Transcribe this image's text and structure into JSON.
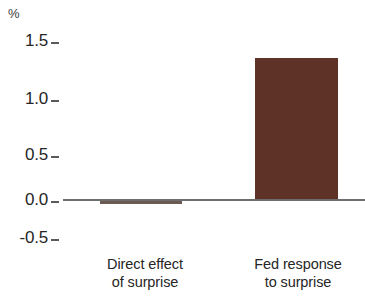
{
  "chart_data": {
    "type": "bar",
    "title": "",
    "subtitle": "",
    "xlabel": "",
    "ylabel": "%",
    "unit_label": "%",
    "categories": [
      "Direct effect of surprise",
      "Fed response to surprise"
    ],
    "category_lines": [
      [
        "Direct effect",
        "of surprise"
      ],
      [
        "Fed response",
        "to surprise"
      ]
    ],
    "values": [
      -0.03,
      1.33
    ],
    "ylim": [
      -0.5,
      1.5
    ],
    "yticks": [
      1.5,
      1.0,
      0.5,
      0.0,
      -0.5
    ],
    "ytick_labels": [
      "1.5",
      "1.0",
      "0.5",
      "0.0",
      "-0.5"
    ],
    "grid": false,
    "legend": null,
    "legend_position": "none",
    "bar_colors": [
      "#6a5a52",
      "#5e3226"
    ],
    "zero_line_color": "#6e6e6e",
    "annotations": []
  },
  "axis": {
    "unit": "%",
    "ticks": [
      {
        "label": "1.5",
        "value": 1.5
      },
      {
        "label": "1.0",
        "value": 1.0
      },
      {
        "label": "0.5",
        "value": 0.5
      },
      {
        "label": "0.0",
        "value": 0.0
      },
      {
        "label": "-0.5",
        "value": -0.5
      }
    ]
  },
  "bars": [
    {
      "name": "direct-effect",
      "line1": "Direct effect",
      "line2": "of surprise",
      "value": -0.03,
      "color": "#6a5a52"
    },
    {
      "name": "fed-response",
      "line1": "Fed response",
      "line2": "to surprise",
      "value": 1.33,
      "color": "#5e3226"
    }
  ]
}
